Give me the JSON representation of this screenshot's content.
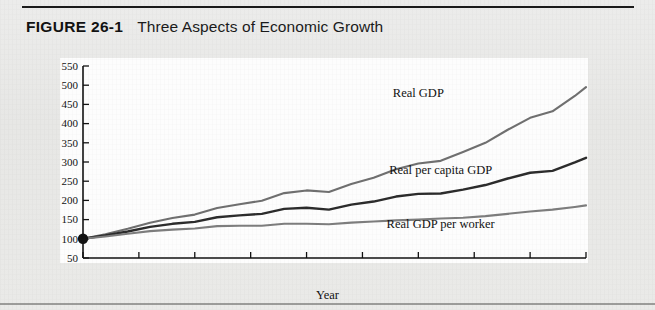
{
  "figure": {
    "number": "FIGURE 26-1",
    "title": "Three Aspects of Economic Growth"
  },
  "chart_data": {
    "type": "line",
    "title": "Three Aspects of Economic Growth",
    "xlabel": "Year",
    "ylabel": "Indexes: 1960 = 100",
    "xlim": [
      1960,
      2005
    ],
    "ylim": [
      50,
      550
    ],
    "ytick_step": 50,
    "xtick_step": 5,
    "yticks": [
      50,
      100,
      150,
      200,
      250,
      300,
      350,
      400,
      450,
      500,
      550
    ],
    "xticks": [
      1960,
      1965,
      1970,
      1975,
      1980,
      1985,
      1990,
      1995,
      2000,
      2005
    ],
    "grid": false,
    "legend_position": "inline-labels",
    "origin_marker": {
      "x": 1960,
      "y": 100,
      "label": "base-year-dot"
    },
    "x": [
      1960,
      1962,
      1964,
      1966,
      1968,
      1970,
      1972,
      1974,
      1976,
      1978,
      1980,
      1982,
      1984,
      1986,
      1988,
      1990,
      1992,
      1994,
      1996,
      1998,
      2000,
      2002,
      2004,
      2005
    ],
    "series": [
      {
        "name": "Real GDP",
        "color": "#6f6f6f",
        "values": [
          100,
          112,
          126,
          142,
          154,
          163,
          180,
          190,
          199,
          219,
          226,
          222,
          243,
          259,
          281,
          296,
          303,
          326,
          350,
          384,
          415,
          432,
          472,
          495
        ]
      },
      {
        "name": "Real per capita GDP",
        "color": "#2b2b2b",
        "values": [
          100,
          109,
          119,
          131,
          139,
          144,
          156,
          161,
          165,
          178,
          181,
          176,
          189,
          197,
          210,
          217,
          218,
          228,
          240,
          257,
          272,
          277,
          299,
          311
        ]
      },
      {
        "name": "Real GDP per worker",
        "color": "#7d7d7d",
        "values": [
          100,
          106,
          113,
          120,
          124,
          127,
          133,
          134,
          134,
          139,
          139,
          138,
          142,
          145,
          148,
          150,
          153,
          155,
          159,
          165,
          171,
          176,
          183,
          187
        ]
      }
    ],
    "annotations": [
      {
        "text": "Real GDP",
        "x": 1990,
        "y": 470
      },
      {
        "text": "Real per capita GDP",
        "x": 1992,
        "y": 268
      },
      {
        "text": "Real GDP per worker",
        "x": 1992,
        "y": 128
      }
    ]
  }
}
